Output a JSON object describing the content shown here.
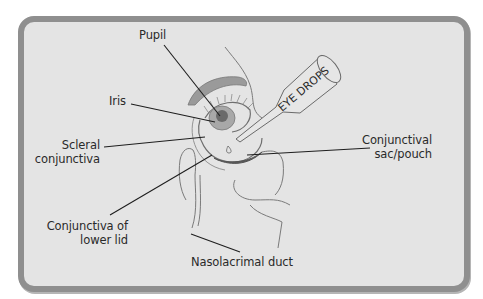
{
  "diagram": {
    "type": "anatomical-illustration",
    "labels": {
      "pupil": "Pupil",
      "iris": "Iris",
      "scleral_1": "Scleral",
      "scleral_2": "conjunctiva",
      "lower_lid_1": "Conjunctiva of",
      "lower_lid_2": "lower lid",
      "nasolacrimal": "Nasolacrimal duct",
      "sac_1": "Conjunctival",
      "sac_2": "sac/pouch",
      "bottle_text": "EYE DROPS"
    },
    "colors": {
      "frame_border": "#8f8f8f",
      "frame_fill": "#e4e4e4",
      "ink": "#2a2a2a",
      "sketch": "#7a7a7a"
    }
  }
}
